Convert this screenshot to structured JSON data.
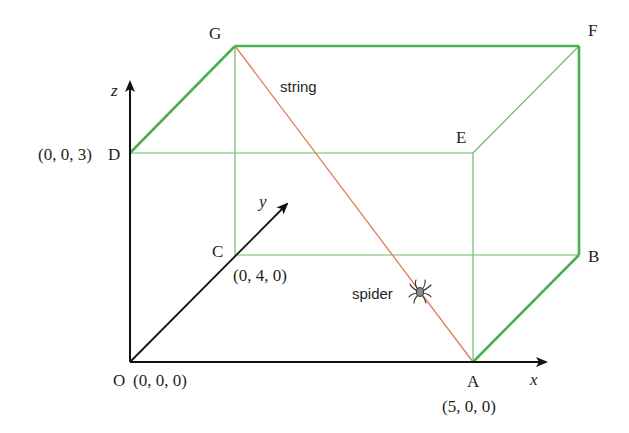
{
  "diagram": {
    "colors": {
      "edge_bold": "#4caf50",
      "edge_thin": "#6dbb6d",
      "string": "#e07a5a",
      "axis": "#111111",
      "text": "#231f20"
    },
    "axes": {
      "x_label": "x",
      "y_label": "y",
      "z_label": "z"
    },
    "vertices": {
      "O": {
        "label": "O",
        "coord": "(0, 0, 0)"
      },
      "A": {
        "label": "A",
        "coord": "(5, 0, 0)"
      },
      "B": {
        "label": "B"
      },
      "C": {
        "label": "C",
        "coord": "(0, 4, 0)"
      },
      "D": {
        "label": "D",
        "coord": "(0, 0, 3)"
      },
      "E": {
        "label": "E"
      },
      "F": {
        "label": "F"
      },
      "G": {
        "label": "G"
      }
    },
    "annotations": {
      "string": "string",
      "spider": "spider"
    },
    "icons": {
      "spider": "spider-icon"
    }
  }
}
